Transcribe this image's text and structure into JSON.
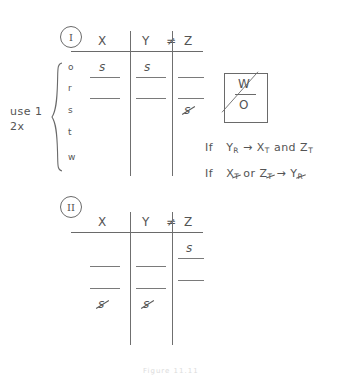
{
  "page": {
    "background_color": "#ffffff",
    "ink_color": "#545454",
    "caption": "Figure 11.11"
  },
  "tables": [
    {
      "label": "I",
      "columns": [
        "X",
        "Y",
        "Z"
      ],
      "header_relation": "≠",
      "row_labels": [
        "o",
        "r",
        "s",
        "t",
        "w"
      ],
      "left_annotation": [
        "use 1",
        "2x"
      ],
      "brace": true,
      "cells": [
        {
          "row": "o",
          "X": "s",
          "Y": "s",
          "Z": "",
          "X_struck": false,
          "Y_struck": false,
          "Z_struck": false,
          "X_rule": true,
          "Y_rule": true,
          "Z_rule": true
        },
        {
          "row": "r",
          "X": "",
          "Y": "",
          "Z": "",
          "X_struck": false,
          "Y_struck": false,
          "Z_struck": false,
          "X_rule": true,
          "Y_rule": true,
          "Z_rule": true
        },
        {
          "row": "s",
          "X": "",
          "Y": "",
          "Z": "s",
          "X_struck": false,
          "Y_struck": false,
          "Z_struck": true,
          "X_rule": false,
          "Y_rule": false,
          "Z_rule": false
        },
        {
          "row": "t",
          "X": "",
          "Y": "",
          "Z": "",
          "X_struck": false,
          "Y_struck": false,
          "Z_struck": false,
          "X_rule": false,
          "Y_rule": false,
          "Z_rule": false
        },
        {
          "row": "w",
          "X": "",
          "Y": "",
          "Z": "",
          "X_struck": false,
          "Y_struck": false,
          "Z_struck": false,
          "X_rule": false,
          "Y_rule": false,
          "Z_rule": false
        }
      ]
    },
    {
      "label": "II",
      "columns": [
        "X",
        "Y",
        "Z"
      ],
      "header_relation": "≠",
      "row_labels": [
        "",
        "",
        ""
      ],
      "cells": [
        {
          "row": "1",
          "X": "",
          "Y": "",
          "Z": "s",
          "X_struck": false,
          "Y_struck": false,
          "Z_struck": false,
          "X_rule": false,
          "Y_rule": false,
          "Z_rule": true
        },
        {
          "row": "2",
          "X": "",
          "Y": "",
          "Z": "",
          "X_struck": false,
          "Y_struck": false,
          "Z_struck": false,
          "X_rule": true,
          "Y_rule": true,
          "Z_rule": true
        },
        {
          "row": "3",
          "X": "",
          "Y": "",
          "Z": "",
          "X_struck": false,
          "Y_struck": false,
          "Z_struck": false,
          "X_rule": true,
          "Y_rule": true,
          "Z_rule": true
        },
        {
          "row": "4",
          "X": "s",
          "Y": "s",
          "Z": "",
          "X_struck": true,
          "Y_struck": true,
          "Z_struck": false,
          "X_rule": false,
          "Y_rule": false,
          "Z_rule": false
        }
      ]
    }
  ],
  "wo_box": {
    "top_letter": "W",
    "bottom_letter": "O",
    "slashed": true
  },
  "conditions": [
    {
      "id": "cond-1",
      "prefix": "If",
      "parts": [
        {
          "base": "Y",
          "sub": "R",
          "sub_struck": false
        },
        {
          "arrow": "→"
        },
        {
          "base": "X",
          "sub": "T",
          "sub_struck": false
        },
        {
          "conj": "and"
        },
        {
          "base": "Z",
          "sub": "T",
          "sub_struck": false
        }
      ]
    },
    {
      "id": "cond-2",
      "prefix": "If",
      "parts": [
        {
          "base": "X",
          "sub": "T",
          "sub_struck": true
        },
        {
          "conj": "or"
        },
        {
          "base": "Z",
          "sub": "T",
          "sub_struck": true
        },
        {
          "arrow": "→"
        },
        {
          "base": "Y",
          "sub": "R",
          "sub_struck": true
        }
      ]
    }
  ]
}
